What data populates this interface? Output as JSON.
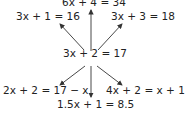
{
  "diagram": {
    "center": {
      "text": "3x + 2 = 17"
    },
    "nodes": [
      {
        "id": "top",
        "text": "6x + 4 = 34"
      },
      {
        "id": "top-left",
        "text": "3x + 1 = 16"
      },
      {
        "id": "top-right",
        "text": "3x + 3 = 18"
      },
      {
        "id": "bottom-left",
        "text": "2x + 2 = 17 − x"
      },
      {
        "id": "bottom-right",
        "text": "4x + 2 = x + 17"
      },
      {
        "id": "bottom",
        "text": "1.5x + 1 = 8.5"
      }
    ],
    "colors": {
      "text": "#222222",
      "arrow": "#333333",
      "background": "#ffffff"
    }
  }
}
